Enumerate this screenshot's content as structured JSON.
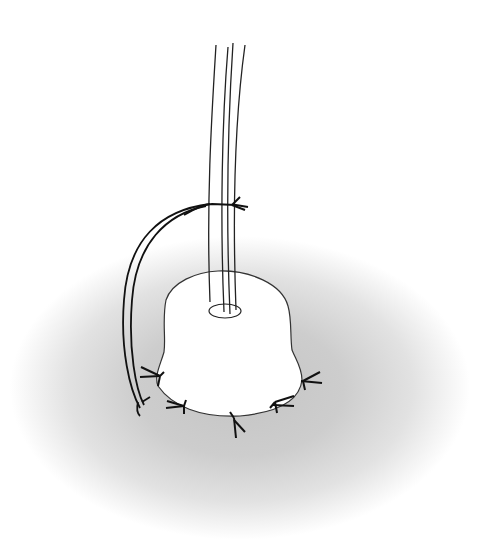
{
  "figure": {
    "colors": {
      "background": "#ffffff",
      "skin_shadow_center": "#c4c4c4",
      "skin_shadow_edge": "#ffffff",
      "stroke": "#1a1a1a",
      "dressing_fill": "#ffffff"
    },
    "elements": {
      "tube": "drain-tube",
      "dressing": "wound-dressing-patch",
      "exit_hole": "tube-exit-hole",
      "anchor_suture": "tube-anchor-suture",
      "suture_threads": "suture-thread-pair",
      "perimeter_sutures_count": 6
    }
  }
}
